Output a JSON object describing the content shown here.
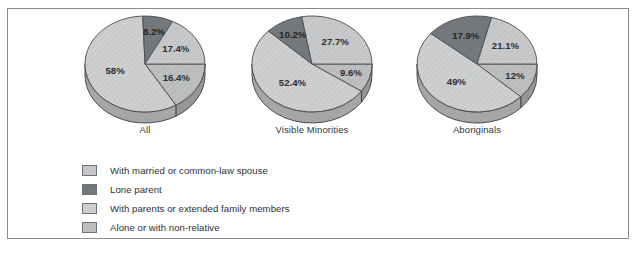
{
  "frame": {
    "border_color": "#8b8b8b",
    "background": "#ffffff"
  },
  "chart_data": {
    "type": "pie",
    "title": "",
    "subtitle": "",
    "xlabel": "",
    "ylabel": "",
    "legend_position": "bottom-left",
    "grid": false,
    "categories": [
      "With married or common-law spouse",
      "Lone parent",
      "With parents or extended family members",
      "Alone or with non-relative"
    ],
    "category_colors": [
      "#c9cacb",
      "#75787b",
      "#cfd0d1",
      "#bfc0c1"
    ],
    "charts": [
      {
        "name": "All",
        "labels": [
          "17.4%",
          "8.2%",
          "58%",
          "16.4%"
        ],
        "values": [
          17.4,
          8.2,
          58,
          16.4
        ],
        "slice_categories": [
          "With married or common-law spouse",
          "Lone parent",
          "With parents or extended family members",
          "Alone or with non-relative"
        ]
      },
      {
        "name": "Visible Minorities",
        "labels": [
          "27.7%",
          "10.2%",
          "52.4%",
          "9.6%"
        ],
        "values": [
          27.7,
          10.2,
          52.4,
          9.6
        ],
        "slice_categories": [
          "With married or common-law spouse",
          "Lone parent",
          "With parents or extended family members",
          "Alone or with non-relative"
        ]
      },
      {
        "name": "Aboriginals",
        "labels": [
          "21.1%",
          "17.9%",
          "49%",
          "12%"
        ],
        "values": [
          21.1,
          17.9,
          49,
          12
        ],
        "slice_categories": [
          "With married or common-law spouse",
          "Lone parent",
          "With parents or extended family members",
          "Alone or with non-relative"
        ]
      }
    ]
  },
  "legend": {
    "items": [
      {
        "label": "With married or common-law spouse",
        "color": "#c9cacb",
        "pattern": "light-hatch"
      },
      {
        "label": "Lone parent",
        "color": "#75787b",
        "pattern": "solid-dark"
      },
      {
        "label": "With parents or extended family members",
        "color": "#cfd0d1",
        "pattern": "fine-hatch"
      },
      {
        "label": "Alone or with non-relative",
        "color": "#bfc0c1",
        "pattern": "plain"
      }
    ]
  }
}
